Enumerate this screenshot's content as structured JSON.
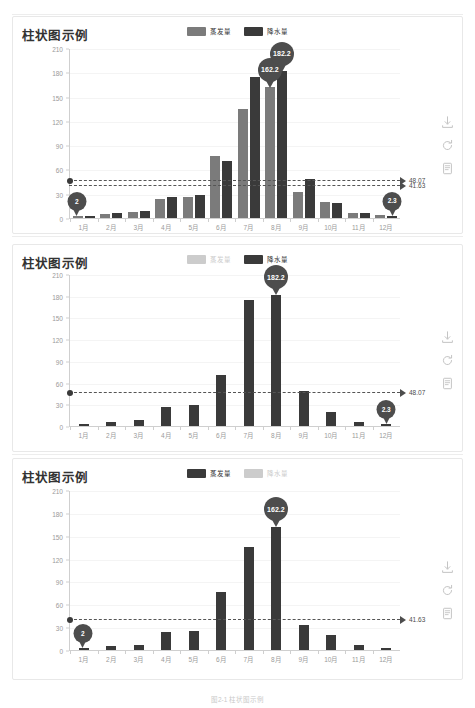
{
  "page": {
    "caption": "图2-1 柱状图示例"
  },
  "toolbox": {
    "items": [
      {
        "name": "save-image",
        "label": "保存为图片"
      },
      {
        "name": "restore",
        "label": "还原"
      },
      {
        "name": "data-view",
        "label": "数据视图"
      }
    ]
  },
  "charts": [
    {
      "id": "chart-1",
      "title": "柱状图示例",
      "legend": [
        {
          "label": "蒸发量",
          "color": "#7b7b7b",
          "active": true
        },
        {
          "label": "降水量",
          "color": "#3a3a3a",
          "active": true
        }
      ],
      "marklines": [
        {
          "value": 48.07,
          "label": "48.07"
        },
        {
          "value": 41.63,
          "label": "41.63"
        }
      ],
      "markpoints": [
        {
          "label": "2",
          "category": "1月",
          "series": 0,
          "value": 2
        },
        {
          "label": "162.2",
          "category": "8月",
          "series": 0,
          "value": 162.2
        },
        {
          "label": "182.2",
          "category": "8月",
          "series": 1,
          "value": 182.2
        },
        {
          "label": "2.3",
          "category": "12月",
          "series": 1,
          "value": 2.3
        }
      ],
      "chart_data": {
        "type": "bar",
        "title": "柱状图示例",
        "xlabel": "",
        "ylabel": "",
        "ylim": [
          0,
          210
        ],
        "yticks": [
          0,
          30,
          60,
          90,
          120,
          150,
          180,
          210
        ],
        "grid": true,
        "legend_position": "top-center",
        "categories": [
          "1月",
          "2月",
          "3月",
          "4月",
          "5月",
          "6月",
          "7月",
          "8月",
          "9月",
          "10月",
          "11月",
          "12月"
        ],
        "series": [
          {
            "name": "蒸发量",
            "color": "#7b7b7b",
            "visible": true,
            "values": [
              2.0,
              4.9,
              7.0,
              23.2,
              25.6,
              76.7,
              135.6,
              162.2,
              32.6,
              20.0,
              6.4,
              3.3
            ]
          },
          {
            "name": "降水量",
            "color": "#3a3a3a",
            "visible": true,
            "values": [
              2.6,
              5.9,
              9.0,
              26.4,
              28.7,
              70.7,
              175.6,
              182.2,
              48.7,
              18.8,
              6.0,
              2.3
            ]
          }
        ]
      }
    },
    {
      "id": "chart-2",
      "title": "柱状图示例",
      "legend": [
        {
          "label": "蒸发量",
          "color": "#cccccc",
          "active": false
        },
        {
          "label": "降水量",
          "color": "#3a3a3a",
          "active": true
        }
      ],
      "marklines": [
        {
          "value": 48.07,
          "label": "48.07"
        }
      ],
      "markpoints": [
        {
          "label": "182.2",
          "category": "8月",
          "series": 1,
          "value": 182.2
        },
        {
          "label": "2.3",
          "category": "12月",
          "series": 1,
          "value": 2.3
        }
      ],
      "chart_data": {
        "type": "bar",
        "title": "柱状图示例",
        "xlabel": "",
        "ylabel": "",
        "ylim": [
          0,
          210
        ],
        "yticks": [
          0,
          30,
          60,
          90,
          120,
          150,
          180,
          210
        ],
        "grid": true,
        "legend_position": "top-center",
        "categories": [
          "1月",
          "2月",
          "3月",
          "4月",
          "5月",
          "6月",
          "7月",
          "8月",
          "9月",
          "10月",
          "11月",
          "12月"
        ],
        "series": [
          {
            "name": "蒸发量",
            "color": "#7b7b7b",
            "visible": false,
            "values": [
              2.0,
              4.9,
              7.0,
              23.2,
              25.6,
              76.7,
              135.6,
              162.2,
              32.6,
              20.0,
              6.4,
              3.3
            ]
          },
          {
            "name": "降水量",
            "color": "#3a3a3a",
            "visible": true,
            "values": [
              2.6,
              5.9,
              9.0,
              26.4,
              28.7,
              70.7,
              175.6,
              182.2,
              48.7,
              18.8,
              6.0,
              2.3
            ]
          }
        ]
      }
    },
    {
      "id": "chart-3",
      "title": "柱状图示例",
      "legend": [
        {
          "label": "蒸发量",
          "color": "#3a3a3a",
          "active": true
        },
        {
          "label": "降水量",
          "color": "#cccccc",
          "active": false
        }
      ],
      "marklines": [
        {
          "value": 41.63,
          "label": "41.63"
        }
      ],
      "markpoints": [
        {
          "label": "162.2",
          "category": "8月",
          "series": 0,
          "value": 162.2
        },
        {
          "label": "2",
          "category": "1月",
          "series": 0,
          "value": 2
        }
      ],
      "chart_data": {
        "type": "bar",
        "title": "柱状图示例",
        "xlabel": "",
        "ylabel": "",
        "ylim": [
          0,
          210
        ],
        "yticks": [
          0,
          30,
          60,
          90,
          120,
          150,
          180,
          210
        ],
        "grid": true,
        "legend_position": "top-center",
        "categories": [
          "1月",
          "2月",
          "3月",
          "4月",
          "5月",
          "6月",
          "7月",
          "8月",
          "9月",
          "10月",
          "11月",
          "12月"
        ],
        "series": [
          {
            "name": "蒸发量",
            "color": "#3a3a3a",
            "visible": true,
            "values": [
              2.0,
              4.9,
              7.0,
              23.2,
              25.6,
              76.7,
              135.6,
              162.2,
              32.6,
              20.0,
              6.4,
              3.3
            ]
          },
          {
            "name": "降水量",
            "color": "#cccccc",
            "visible": false,
            "values": [
              2.6,
              5.9,
              9.0,
              26.4,
              28.7,
              70.7,
              175.6,
              182.2,
              48.7,
              18.8,
              6.0,
              2.3
            ]
          }
        ]
      }
    }
  ]
}
